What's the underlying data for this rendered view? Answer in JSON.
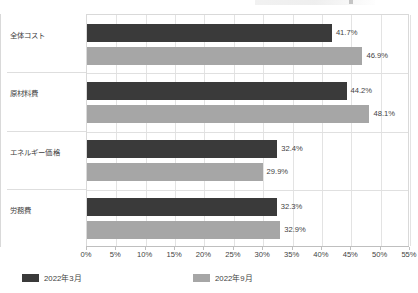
{
  "chart_data": {
    "type": "bar",
    "orientation": "horizontal",
    "title": "",
    "xlabel": "",
    "ylabel": "",
    "xlim": [
      0,
      55
    ],
    "xtick_labels": [
      "0%",
      "5%",
      "10%",
      "15%",
      "20%",
      "25%",
      "30%",
      "35%",
      "40%",
      "45%",
      "50%",
      "55%"
    ],
    "xtick_values": [
      0,
      5,
      10,
      15,
      20,
      25,
      30,
      35,
      40,
      45,
      50,
      55
    ],
    "grid": true,
    "legend_position": "bottom-left",
    "categories": [
      "全体コスト",
      "原材料費",
      "エネルギー価格",
      "労務費"
    ],
    "series": [
      {
        "name": "2022年3月",
        "color": "#3a3a3a",
        "values": [
          41.7,
          44.2,
          32.4,
          32.3
        ],
        "data_labels": [
          "41.7%",
          "44.2%",
          "32.4%",
          "32.3%"
        ]
      },
      {
        "name": "2022年9月",
        "color": "#a6a6a6",
        "values": [
          46.9,
          48.1,
          29.9,
          32.9
        ],
        "data_labels": [
          "46.9%",
          "48.1%",
          "29.9%",
          "32.9%"
        ]
      }
    ]
  },
  "legend": {
    "items": [
      {
        "label": "2022年3月",
        "color": "#3a3a3a"
      },
      {
        "label": "2022年9月",
        "color": "#a6a6a6"
      }
    ]
  }
}
